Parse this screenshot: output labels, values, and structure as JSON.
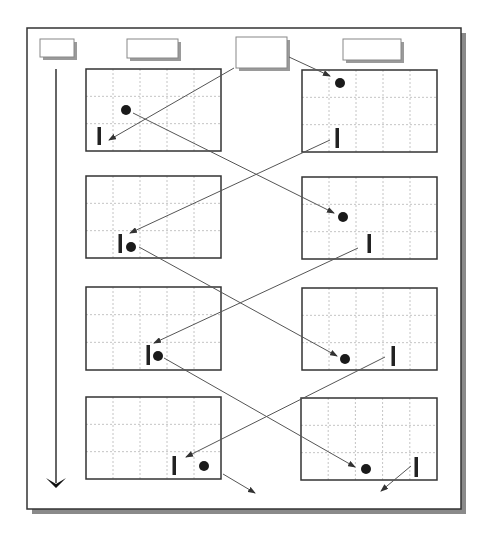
{
  "diagram": {
    "title": "",
    "frame": {
      "x": 27,
      "y": 28,
      "w": 434,
      "h": 481,
      "stroke": "#333333",
      "shadow": "#8a8a8a"
    },
    "time_arrow": {
      "x": 56,
      "y1": 69,
      "y2": 487
    },
    "header_boxes": [
      {
        "x": 40,
        "y": 39,
        "w": 34,
        "h": 18,
        "label": ""
      },
      {
        "x": 127,
        "y": 39,
        "w": 51,
        "h": 19,
        "label": ""
      },
      {
        "x": 236,
        "y": 37,
        "w": 51,
        "h": 31,
        "label": ""
      },
      {
        "x": 343,
        "y": 39,
        "w": 58,
        "h": 21,
        "label": ""
      }
    ],
    "grid": {
      "cols": 5,
      "rows": 3,
      "stroke": "#b5b5b5"
    },
    "panels": [
      {
        "side": "left",
        "x": 86,
        "y": 69,
        "w": 135,
        "h": 82,
        "ball": [
          126,
          110
        ],
        "paddle": [
          99,
          127,
          18
        ]
      },
      {
        "side": "right",
        "x": 302,
        "y": 70,
        "w": 135,
        "h": 82,
        "ball": [
          340,
          83
        ],
        "paddle": [
          337,
          128,
          20
        ]
      },
      {
        "side": "left",
        "x": 86,
        "y": 176,
        "w": 135,
        "h": 82,
        "ball": [
          131,
          247
        ],
        "paddle": [
          120,
          234,
          19
        ]
      },
      {
        "side": "right",
        "x": 302,
        "y": 177,
        "w": 135,
        "h": 82,
        "ball": [
          343,
          217
        ],
        "paddle": [
          369,
          234,
          19
        ]
      },
      {
        "side": "left",
        "x": 86,
        "y": 287,
        "w": 135,
        "h": 83,
        "ball": [
          158,
          356
        ],
        "paddle": [
          148,
          345,
          20
        ]
      },
      {
        "side": "right",
        "x": 302,
        "y": 288,
        "w": 135,
        "h": 82,
        "ball": [
          345,
          359
        ],
        "paddle": [
          393,
          346,
          20
        ]
      },
      {
        "side": "left",
        "x": 86,
        "y": 397,
        "w": 135,
        "h": 82,
        "ball": [
          204,
          466
        ],
        "paddle": [
          174,
          456,
          19
        ]
      },
      {
        "side": "right",
        "x": 301,
        "y": 398,
        "w": 136,
        "h": 82,
        "ball": [
          366,
          469
        ],
        "paddle": [
          416,
          457,
          20
        ]
      }
    ],
    "arrows": [
      {
        "from": [
          234,
          68
        ],
        "to": [
          109,
          140
        ]
      },
      {
        "from": [
          289,
          57
        ],
        "to": [
          330,
          76
        ]
      },
      {
        "from": [
          133,
          113
        ],
        "to": [
          334,
          213
        ]
      },
      {
        "from": [
          330,
          140
        ],
        "to": [
          130,
          233
        ]
      },
      {
        "from": [
          139,
          247
        ],
        "to": [
          337,
          356
        ]
      },
      {
        "from": [
          358,
          248
        ],
        "to": [
          154,
          343
        ]
      },
      {
        "from": [
          164,
          358
        ],
        "to": [
          355,
          467
        ]
      },
      {
        "from": [
          385,
          357
        ],
        "to": [
          186,
          457
        ]
      },
      {
        "from": [
          223,
          474
        ],
        "to": [
          255,
          493
        ]
      },
      {
        "from": [
          411,
          466
        ],
        "to": [
          381,
          491
        ]
      }
    ],
    "colors": {
      "line": "#333333",
      "arrow": "#555555",
      "ball": "#1a1a1a",
      "paddle": "#222222"
    }
  }
}
